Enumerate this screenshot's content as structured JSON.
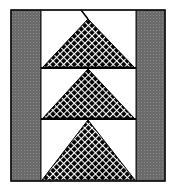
{
  "diagram": {
    "type": "quilt-block",
    "pattern": "flying-geese-column",
    "colors": {
      "background": "#ffffff",
      "outline": "#111111",
      "side_strip": "#6b6b6b",
      "side_strip_dot": "#8a8a8a",
      "triangle_fill": "#000000",
      "triangle_dots": "#ffffff",
      "sky": "#ffffff"
    },
    "side_strips": [
      "left",
      "right"
    ],
    "geese": [
      {
        "row": 1,
        "direction": "up"
      },
      {
        "row": 2,
        "direction": "up"
      },
      {
        "row": 3,
        "direction": "up"
      }
    ]
  }
}
